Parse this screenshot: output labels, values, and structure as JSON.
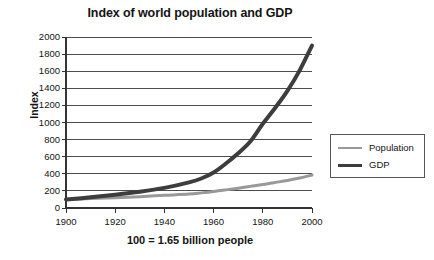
{
  "chart_data": {
    "type": "line",
    "title": "Index of world population and GDP",
    "caption": "100 = 1.65 billion people",
    "xlabel": "",
    "ylabel": "Index",
    "xlim": [
      1900,
      2000
    ],
    "ylim": [
      0,
      2000
    ],
    "grid": true,
    "legend_position": "right-outside",
    "x_ticks": [
      "1900",
      "1920",
      "1940",
      "1960",
      "1980",
      "2000"
    ],
    "y_ticks": [
      "0",
      "200",
      "400",
      "600",
      "800",
      "1000",
      "1200",
      "1400",
      "1600",
      "1800",
      "2000"
    ],
    "x": [
      1900,
      1910,
      1920,
      1930,
      1940,
      1950,
      1955,
      1960,
      1965,
      1970,
      1975,
      1980,
      1985,
      1990,
      1995,
      2000
    ],
    "series": [
      {
        "name": "Population",
        "color": "#999999",
        "width": 3,
        "values": [
          100,
          110,
          120,
          133,
          148,
          163,
          177,
          193,
          212,
          232,
          253,
          274,
          298,
          322,
          350,
          385
        ]
      },
      {
        "name": "GDP",
        "color": "#3d3d3d",
        "width": 4,
        "values": [
          100,
          125,
          155,
          190,
          235,
          300,
          345,
          415,
          520,
          640,
          780,
          985,
          1170,
          1370,
          1610,
          1900
        ]
      }
    ]
  },
  "legend": {
    "items": [
      {
        "label": "Population"
      },
      {
        "label": "GDP"
      }
    ]
  },
  "colors": {
    "population": "#999999",
    "gdp": "#3d3d3d",
    "axis": "#333333",
    "grid": "#4d4d4d",
    "legend_border": "#555555",
    "background": "#ffffff"
  }
}
